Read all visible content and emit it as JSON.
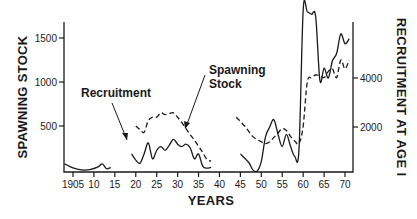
{
  "chart_data": {
    "type": "line",
    "title": "",
    "xlabel": "YEARS",
    "ylabel_left": "SPAWNING STOCK",
    "ylabel_right": "RECRUITMENT AT AGE I",
    "x_ticks": [
      "1905",
      "10",
      "15",
      "20",
      "25",
      "30",
      "35",
      "40",
      "45",
      "50",
      "55",
      "60",
      "65",
      "70"
    ],
    "xlim": [
      1903,
      1972
    ],
    "ylim_left": [
      0,
      1700
    ],
    "ylim_right": [
      0,
      7000
    ],
    "y_ticks_left": [
      "500",
      "1000",
      "1500"
    ],
    "y_ticks_right": [
      "2000",
      "4000"
    ],
    "grid": false,
    "legend": "inline annotations",
    "annotations": [
      "Recruitment",
      "Spawning Stock"
    ],
    "series": [
      {
        "name": "Recruitment",
        "axis": "right",
        "style": "solid",
        "segments": [
          [
            [
              1903,
              500
            ],
            [
              1905,
              330
            ],
            [
              1907,
              250
            ],
            [
              1909,
              260
            ],
            [
              1911,
              370
            ],
            [
              1912,
              500
            ],
            [
              1913,
              300
            ],
            [
              1914,
              350
            ]
          ],
          [
            [
              1919,
              900
            ],
            [
              1920,
              650
            ],
            [
              1921,
              520
            ],
            [
              1922,
              900
            ],
            [
              1923,
              1350
            ],
            [
              1924,
              700
            ],
            [
              1925,
              1050
            ],
            [
              1926,
              1200
            ],
            [
              1927,
              1050
            ],
            [
              1928,
              1250
            ],
            [
              1929,
              1500
            ],
            [
              1930,
              1300
            ],
            [
              1931,
              1200
            ],
            [
              1932,
              1300
            ],
            [
              1933,
              1150
            ],
            [
              1934,
              700
            ],
            [
              1935,
              900
            ],
            [
              1936,
              400
            ],
            [
              1937,
              320
            ],
            [
              1938,
              350
            ]
          ],
          [
            [
              1945,
              900
            ],
            [
              1947,
              550
            ],
            [
              1948,
              250
            ],
            [
              1949,
              200
            ],
            [
              1950,
              600
            ],
            [
              1951,
              1600
            ],
            [
              1952,
              2000
            ],
            [
              1953,
              2300
            ],
            [
              1954,
              1700
            ],
            [
              1955,
              1200
            ],
            [
              1956,
              1700
            ],
            [
              1957,
              1200
            ],
            [
              1958,
              800
            ],
            [
              1959,
              1100
            ],
            [
              1960,
              7000
            ],
            [
              1961,
              6700
            ],
            [
              1962,
              6600
            ],
            [
              1963,
              6500
            ],
            [
              1964,
              3900
            ],
            [
              1965,
              4400
            ],
            [
              1966,
              4000
            ],
            [
              1967,
              4700
            ],
            [
              1968,
              5000
            ],
            [
              1969,
              5800
            ],
            [
              1970,
              5400
            ],
            [
              1971,
              5600
            ]
          ]
        ]
      },
      {
        "name": "Spawning Stock",
        "axis": "left",
        "style": "dashed",
        "segments": [
          [
            [
              1920,
              500
            ],
            [
              1921,
              460
            ],
            [
              1922,
              430
            ],
            [
              1923,
              560
            ],
            [
              1924,
              600
            ],
            [
              1925,
              600
            ],
            [
              1926,
              650
            ],
            [
              1927,
              630
            ],
            [
              1928,
              640
            ],
            [
              1929,
              650
            ],
            [
              1930,
              600
            ],
            [
              1931,
              540
            ],
            [
              1932,
              470
            ],
            [
              1933,
              400
            ],
            [
              1934,
              340
            ],
            [
              1935,
              270
            ],
            [
              1936,
              200
            ],
            [
              1937,
              120
            ],
            [
              1938,
              100
            ]
          ],
          [
            [
              1944,
              600
            ],
            [
              1946,
              500
            ],
            [
              1948,
              380
            ],
            [
              1950,
              320
            ],
            [
              1951,
              300
            ],
            [
              1952,
              320
            ],
            [
              1953,
              370
            ],
            [
              1954,
              420
            ],
            [
              1955,
              470
            ],
            [
              1956,
              450
            ],
            [
              1957,
              380
            ],
            [
              1958,
              330
            ],
            [
              1959,
              300
            ],
            [
              1960,
              500
            ],
            [
              1961,
              1000
            ],
            [
              1962,
              1050
            ],
            [
              1963,
              1080
            ],
            [
              1964,
              1070
            ],
            [
              1965,
              1050
            ],
            [
              1966,
              1120
            ],
            [
              1967,
              1150
            ],
            [
              1968,
              1050
            ],
            [
              1969,
              1250
            ],
            [
              1970,
              1150
            ],
            [
              1971,
              1250
            ]
          ]
        ]
      }
    ]
  }
}
